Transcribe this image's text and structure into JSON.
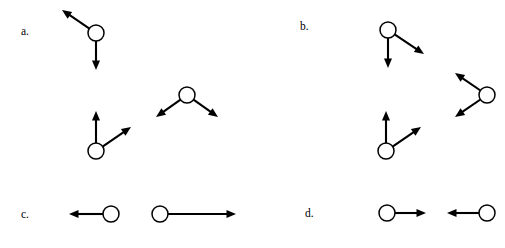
{
  "figure": {
    "width": 505,
    "height": 248,
    "background_color": "#ffffff",
    "stroke_color": "#000000",
    "circle_fill_color": "#ffffff"
  },
  "panels": [
    {
      "id": "a",
      "label": "a.",
      "label_x": 21,
      "label_y": 26,
      "objects": [
        {
          "name": "object-a1",
          "circle": {
            "cx": 96,
            "cy": 33,
            "r": 8
          },
          "vectors": [
            {
              "name": "vector-a1-up-left",
              "direction": "up-left",
              "angle_deg": 145,
              "length": 41,
              "tip_x": 62,
              "tip_y": 10
            },
            {
              "name": "vector-a1-down",
              "direction": "down",
              "angle_deg": 270,
              "length": 37,
              "tip_x": 96,
              "tip_y": 70
            }
          ]
        },
        {
          "name": "object-a2",
          "circle": {
            "cx": 187,
            "cy": 95,
            "r": 8
          },
          "vectors": [
            {
              "name": "vector-a2-down-left",
              "direction": "down-left",
              "angle_deg": 215,
              "length": 38,
              "tip_x": 156,
              "tip_y": 117
            },
            {
              "name": "vector-a2-down-right",
              "direction": "down-right",
              "angle_deg": 325,
              "length": 38,
              "tip_x": 218,
              "tip_y": 117
            }
          ]
        },
        {
          "name": "object-a3",
          "circle": {
            "cx": 96,
            "cy": 151,
            "r": 8
          },
          "vectors": [
            {
              "name": "vector-a3-up",
              "direction": "up",
              "angle_deg": 90,
              "length": 40,
              "tip_x": 96,
              "tip_y": 111
            },
            {
              "name": "vector-a3-up-right",
              "direction": "up-right",
              "angle_deg": 35,
              "length": 42,
              "tip_x": 131,
              "tip_y": 127
            }
          ]
        }
      ]
    },
    {
      "id": "b",
      "label": "b.",
      "label_x": 300,
      "label_y": 21,
      "objects": [
        {
          "name": "object-b1",
          "circle": {
            "cx": 388,
            "cy": 30,
            "r": 8
          },
          "vectors": [
            {
              "name": "vector-b1-down-right",
              "direction": "down-right",
              "angle_deg": 325,
              "length": 42,
              "tip_x": 424,
              "tip_y": 54
            },
            {
              "name": "vector-b1-down",
              "direction": "down",
              "angle_deg": 270,
              "length": 38,
              "tip_x": 388,
              "tip_y": 68
            }
          ]
        },
        {
          "name": "object-b2",
          "circle": {
            "cx": 487,
            "cy": 95,
            "r": 8
          },
          "vectors": [
            {
              "name": "vector-b2-up-left",
              "direction": "up-left",
              "angle_deg": 145,
              "length": 38,
              "tip_x": 455,
              "tip_y": 73
            },
            {
              "name": "vector-b2-down-left",
              "direction": "down-left",
              "angle_deg": 215,
              "length": 38,
              "tip_x": 455,
              "tip_y": 117
            }
          ]
        },
        {
          "name": "object-b3",
          "circle": {
            "cx": 386,
            "cy": 151,
            "r": 8
          },
          "vectors": [
            {
              "name": "vector-b3-up",
              "direction": "up",
              "angle_deg": 90,
              "length": 40,
              "tip_x": 386,
              "tip_y": 111
            },
            {
              "name": "vector-b3-up-right",
              "direction": "up-right",
              "angle_deg": 35,
              "length": 42,
              "tip_x": 421,
              "tip_y": 127
            }
          ]
        }
      ]
    },
    {
      "id": "c",
      "label": "c.",
      "label_x": 21,
      "label_y": 209,
      "objects": [
        {
          "name": "object-c1",
          "circle": {
            "cx": 111,
            "cy": 214,
            "r": 8
          },
          "vectors": [
            {
              "name": "vector-c1-left-short",
              "direction": "left",
              "angle_deg": 180,
              "length": 42,
              "tip_x": 69,
              "tip_y": 214
            }
          ]
        },
        {
          "name": "object-c2",
          "circle": {
            "cx": 160,
            "cy": 214,
            "r": 8
          },
          "vectors": [
            {
              "name": "vector-c2-right-long",
              "direction": "right",
              "angle_deg": 0,
              "length": 76,
              "tip_x": 236,
              "tip_y": 214
            }
          ]
        }
      ]
    },
    {
      "id": "d",
      "label": "d.",
      "label_x": 305,
      "label_y": 208,
      "objects": [
        {
          "name": "object-d1",
          "circle": {
            "cx": 387,
            "cy": 213,
            "r": 8
          },
          "vectors": [
            {
              "name": "vector-d1-right",
              "direction": "right",
              "angle_deg": 0,
              "length": 39,
              "tip_x": 426,
              "tip_y": 213
            }
          ]
        },
        {
          "name": "object-d2",
          "circle": {
            "cx": 487,
            "cy": 213,
            "r": 8
          },
          "vectors": [
            {
              "name": "vector-d2-left",
              "direction": "left",
              "angle_deg": 180,
              "length": 40,
              "tip_x": 447,
              "tip_y": 213
            }
          ]
        }
      ]
    }
  ]
}
